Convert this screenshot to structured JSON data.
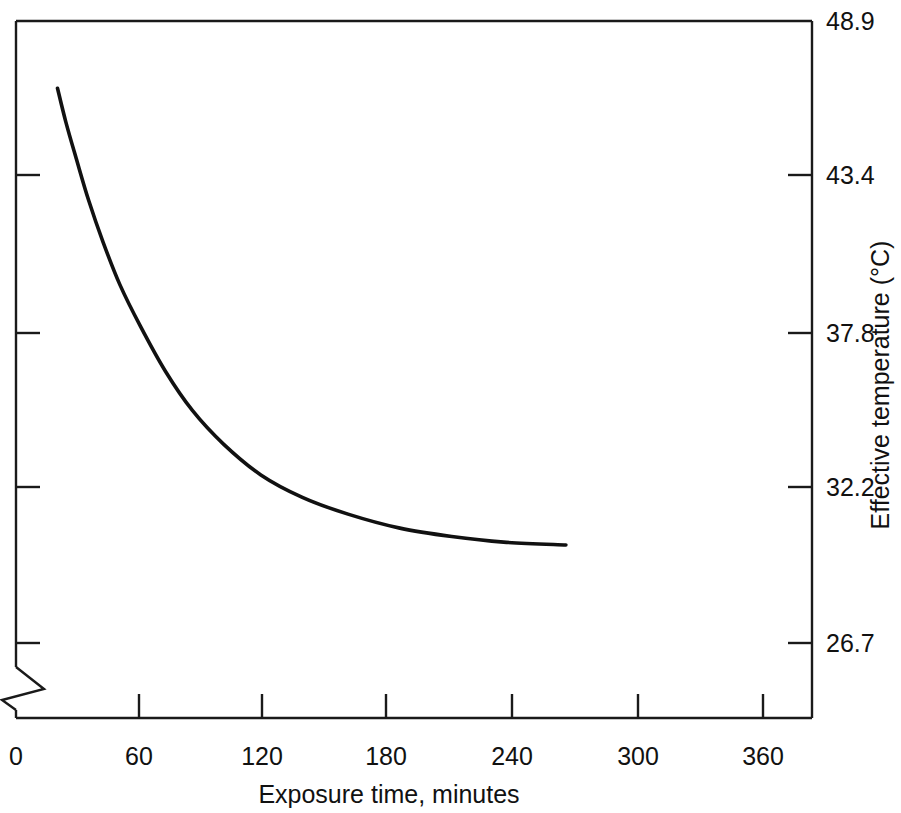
{
  "chart_data": {
    "type": "line",
    "title": "",
    "subtitle": "",
    "xlabel": "Exposure time, minutes",
    "ylabel": "Effective temperature (°C)",
    "xlim": [
      0,
      390
    ],
    "ylim": [
      24.0,
      48.9
    ],
    "xticks": [
      0,
      60,
      120,
      180,
      240,
      300,
      360
    ],
    "xticklabels": [
      "0",
      "60",
      "120",
      "180",
      "240",
      "300",
      "360"
    ],
    "yticks": [
      26.7,
      32.2,
      37.8,
      43.4,
      48.9
    ],
    "yticklabels": [
      "26.7",
      "32.2",
      "37.8",
      "43.4",
      "48.9"
    ],
    "ytick_label_position": "right",
    "ylabel_position": "right",
    "grid": false,
    "legend": null,
    "axis_break": {
      "axis": "y",
      "style": "zigzag",
      "note": "broken y-axis near the bottom of the left spine"
    },
    "series": [
      {
        "name": "Effective temperature decay",
        "color": "#111111",
        "linewidth": 3.6,
        "x": [
          20,
          24,
          29,
          35,
          42,
          50,
          60,
          72,
          85,
          100,
          118,
          138,
          160,
          185,
          210,
          235,
          265
        ],
        "y": [
          46.5,
          45.3,
          44.0,
          42.5,
          41.0,
          39.5,
          38.0,
          36.4,
          35.0,
          33.8,
          32.7,
          31.9,
          31.3,
          30.8,
          30.5,
          30.3,
          30.2
        ]
      }
    ],
    "annotations": []
  },
  "geometry": {
    "frame": {
      "left": 16,
      "right": 812,
      "top": 21,
      "bottom": 718
    },
    "xtick_px": [
      16,
      139,
      262,
      386,
      512,
      638,
      763
    ],
    "ytick_px": [
      643,
      487,
      333,
      175,
      21
    ]
  },
  "axis_labels": {
    "x_title": "Exposure time, minutes",
    "y_title": "Effective temperature (°C)"
  }
}
